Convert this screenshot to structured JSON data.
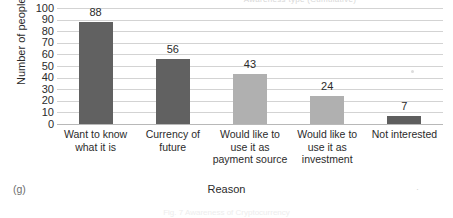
{
  "figure": {
    "subfigure_label": "(g)",
    "clipped_title": "Awareness type (Cumulative)",
    "footer_ghost": "Fig. 7  Awareness of Cryptocurrency",
    "stray_mark": "·"
  },
  "chart_data": {
    "type": "bar",
    "title": "",
    "xlabel": "Reason",
    "ylabel": "Number of people (Cumulative)",
    "categories": [
      "Want to know what it is",
      "Currency of future",
      "Would like to use it as payment source",
      "Would like to use it as investment",
      "Not interested"
    ],
    "values": [
      88,
      56,
      43,
      24,
      7
    ],
    "value_labels": [
      "88",
      "56",
      "43",
      "24",
      "7"
    ],
    "ylim": [
      0,
      100
    ],
    "ytick_labels": [
      "100",
      "90",
      "80",
      "70",
      "60",
      "50",
      "40",
      "30",
      "20",
      "10",
      "0"
    ],
    "ytick_values": [
      100,
      90,
      80,
      70,
      60,
      50,
      40,
      30,
      20,
      10,
      0
    ],
    "grid": true,
    "legend": false,
    "bar_colors": [
      "#616161",
      "#616161",
      "#b0b0b0",
      "#b0b0b0",
      "#5e5e5e"
    ],
    "colors": {
      "bar_dark": "#616161",
      "bar_light": "#b0b0b0",
      "gridline": "#d3d3d3",
      "axis": "#b8b8b8",
      "text": "#2b2b2b",
      "background": "#ffffff"
    }
  }
}
